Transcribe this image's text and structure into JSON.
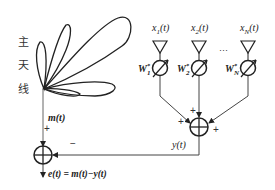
{
  "diagram": {
    "main_antenna_label": [
      "主",
      "天",
      "线"
    ],
    "inputs": [
      {
        "label": "x1(t)",
        "sub": "1",
        "weight": "W",
        "weight_sub": "1",
        "weight_sup": "*"
      },
      {
        "label": "x2(t)",
        "sub": "2",
        "weight": "W",
        "weight_sub": "2",
        "weight_sup": "*"
      },
      {
        "label": "xN(t)",
        "sub": "N",
        "weight": "W",
        "weight_sub": "N",
        "weight_sup": "*"
      }
    ],
    "ellipsis": "···",
    "main_signal_label": "m(t)",
    "array_output_label": "y(t)",
    "error_label": "e(t) = m(t)−y(t)",
    "signs": {
      "main_plus": "+",
      "feedback_minus": "−",
      "sum_plus_top": "+",
      "sum_plus_left": "+",
      "sum_plus_right": "+"
    },
    "colors": {
      "stroke": "#222222",
      "background": "#ffffff"
    }
  }
}
